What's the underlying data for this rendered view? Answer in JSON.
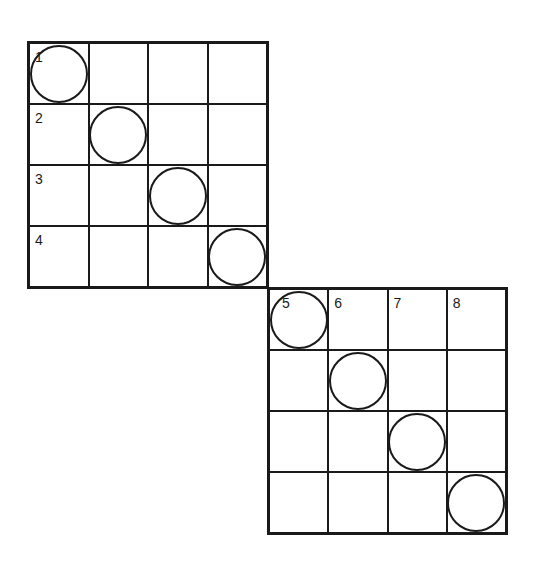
{
  "grids": [
    {
      "name": "upper-grid",
      "row_labels": [
        "1",
        "2",
        "3",
        "4"
      ],
      "circles": [
        [
          0,
          0
        ],
        [
          1,
          1
        ],
        [
          2,
          2
        ],
        [
          3,
          3
        ]
      ]
    },
    {
      "name": "lower-grid",
      "column_labels": [
        "5",
        "6",
        "7",
        "8"
      ],
      "circles": [
        [
          0,
          0
        ],
        [
          1,
          1
        ],
        [
          2,
          2
        ],
        [
          3,
          3
        ]
      ]
    }
  ],
  "labels": {
    "n1": "1",
    "n2": "2",
    "n3": "3",
    "n4": "4",
    "n5": "5",
    "n6": "6",
    "n7": "7",
    "n8": "8"
  },
  "colors": {
    "line": "#1a1a1a",
    "background": "#ffffff"
  }
}
